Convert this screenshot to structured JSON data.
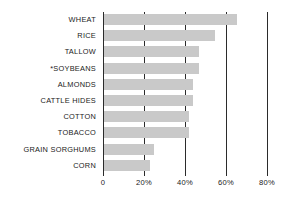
{
  "chart_data": {
    "type": "bar",
    "orientation": "horizontal",
    "title": "",
    "subtitle": "",
    "xlabel": "",
    "ylabel": "",
    "categories": [
      "WHEAT",
      "RICE",
      "TALLOW",
      "*SOYBEANS",
      "ALMONDS",
      "CATTLE HIDES",
      "COTTON",
      "TOBACCO",
      "GRAIN SORGHUMS",
      "CORN"
    ],
    "values": [
      65,
      54,
      46.5,
      46.5,
      43.5,
      43.5,
      41.5,
      41.5,
      24.5,
      22.5
    ],
    "value_unit": "%",
    "xlim": [
      0,
      80
    ],
    "xticks": [
      0,
      20,
      40,
      60,
      80
    ],
    "xtick_labels": [
      "0",
      "20%",
      "40%",
      "60%",
      "80%"
    ],
    "grid": true,
    "grid_axis": "x",
    "legend": null,
    "bar_color": "#c9c9c9",
    "axis_color": "#2b2b2b",
    "background_color": "#ffffff",
    "annotations": [
      "*SOYBEANS carries an asterisk footnote marker"
    ]
  }
}
